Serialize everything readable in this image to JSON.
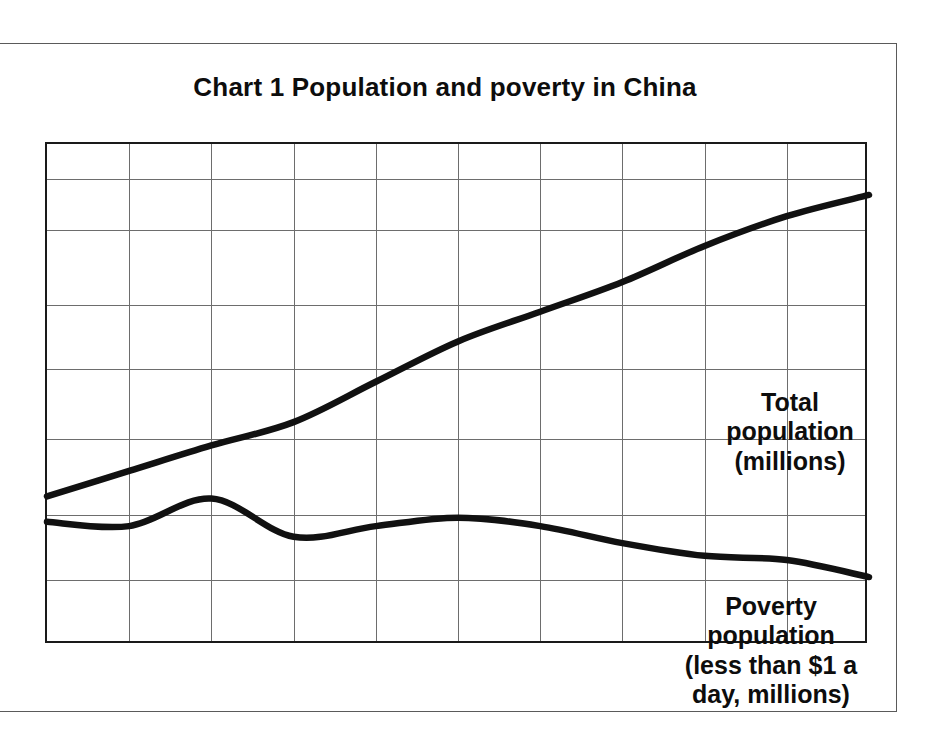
{
  "chart_data": {
    "type": "line",
    "title": "Chart 1  Population and poverty in China",
    "xlabel": "",
    "ylabel": "",
    "grid": true,
    "legend_position": "inline-annotations",
    "x": [
      1950,
      1955,
      1960,
      1965,
      1970,
      1975,
      1980,
      1985,
      1990,
      1995,
      2000
    ],
    "xlim": [
      1950,
      2000
    ],
    "xticks": [
      "1950",
      "1955",
      "1960",
      "1965",
      "1970",
      "1975",
      "1980",
      "1985",
      "1990",
      "1995",
      "2000"
    ],
    "yticks": [
      "00",
      "00",
      "00",
      "00",
      "00",
      "00",
      "00"
    ],
    "ytick_note": "y-axis labels are cropped at the left edge of the scan; only the trailing '00' of each value is visible",
    "series": [
      {
        "name": "Total population (millions)",
        "values": [
          550,
          610,
          670,
          725,
          820,
          915,
          985,
          1055,
          1140,
          1210,
          1260
        ],
        "annotation": "Total\npopulation\n(millions)"
      },
      {
        "name": "Poverty population (less than $1 a day, millions)",
        "values": [
          490,
          480,
          545,
          455,
          480,
          500,
          480,
          440,
          410,
          400,
          360
        ],
        "annotation": "Poverty\npopulation\n(less than $1 a\nday, millions)"
      }
    ]
  },
  "annotations": {
    "total": "Total\npopulation\n(millions)",
    "poverty": "Poverty\npopulation\n(less than $1 a\nday, millions)"
  },
  "colors": {
    "line": "#111111",
    "grid": "#6d6d6d",
    "axis": "#1a1a1a",
    "text": "#0d0d0d",
    "background": "#ffffff"
  }
}
